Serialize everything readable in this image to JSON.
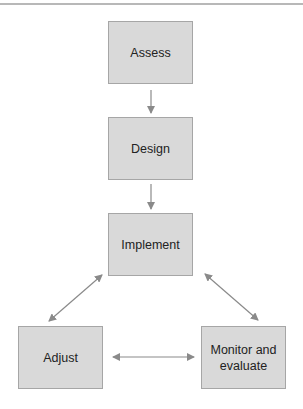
{
  "diagram": {
    "type": "process-cycle",
    "nodes": [
      {
        "id": "assess",
        "label": "Assess"
      },
      {
        "id": "design",
        "label": "Design"
      },
      {
        "id": "implement",
        "label": "Implement"
      },
      {
        "id": "adjust",
        "label": "Adjust"
      },
      {
        "id": "monitor",
        "label": "Monitor and evaluate"
      }
    ],
    "edges": [
      {
        "from": "assess",
        "to": "design",
        "direction": "one-way"
      },
      {
        "from": "design",
        "to": "implement",
        "direction": "one-way"
      },
      {
        "from": "implement",
        "to": "adjust",
        "direction": "two-way"
      },
      {
        "from": "implement",
        "to": "monitor",
        "direction": "two-way"
      },
      {
        "from": "adjust",
        "to": "monitor",
        "direction": "two-way"
      }
    ],
    "colors": {
      "box_fill": "#d9d9d9",
      "box_border": "#a6a6a6",
      "arrow": "#8a8a8a",
      "text": "#222222"
    }
  }
}
